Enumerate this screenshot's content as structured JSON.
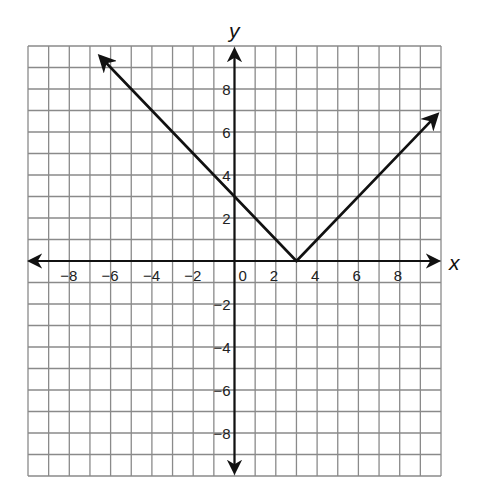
{
  "chart_data": {
    "type": "line",
    "title": "",
    "xlabel": "x",
    "ylabel": "y",
    "xlim": [
      -10,
      10
    ],
    "ylim": [
      -10,
      10
    ],
    "grid": true,
    "grid_step": 1,
    "x_tick_labels": [
      "-8",
      "-6",
      "-4",
      "-2",
      "0",
      "2",
      "4",
      "6",
      "8"
    ],
    "y_tick_labels": [
      "8",
      "6",
      "4",
      "2",
      "-2",
      "-4",
      "-6",
      "-8"
    ],
    "series": [
      {
        "name": "y = |x - 3|",
        "points": [
          [
            -6.5,
            9.5
          ],
          [
            0,
            3
          ],
          [
            3,
            0
          ],
          [
            9.8,
            6.8
          ]
        ],
        "arrows": "both-ends",
        "vertex": [
          3,
          0
        ],
        "y_intercept": 3
      }
    ],
    "legend": null
  },
  "labels": {
    "x_axis": "x",
    "y_axis": "y",
    "origin": "0"
  }
}
